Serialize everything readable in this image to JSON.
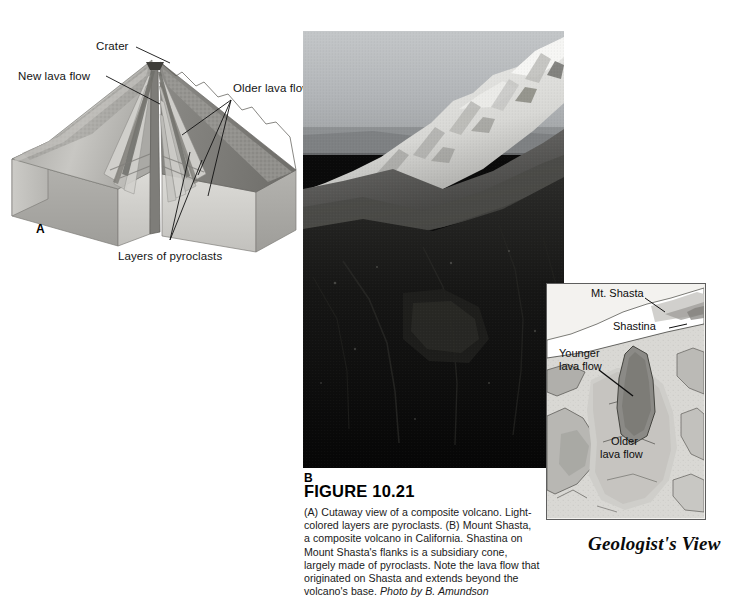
{
  "figure": {
    "number": "FIGURE 10.21",
    "caption_main": "(A) Cutaway view of a composite volcano. Light-colored layers are pyroclasts. (B) Mount Shasta, a composite volcano in California. Shastina on Mount Shasta's flanks is a subsidiary cone, largely made of pyroclasts. Note the lava flow that originated on Shasta and extends beyond the volcano's base. ",
    "caption_credit": "Photo by B. Amundson"
  },
  "part_a": {
    "letter": "A",
    "labels": {
      "crater": "Crater",
      "new_lava_flow": "New lava flow",
      "older_lava_flows": "Older lava flows",
      "layers_of_pyroclasts": "Layers of pyroclasts"
    },
    "colors": {
      "block_top_face": "#b9b8b4",
      "block_front_face": "#a9a8a4",
      "block_side_face": "#c3c2be",
      "cone_surface": "#8f8e8a",
      "pyroclast_layer": "#d9d8d4",
      "lava_flow_dark": "#6e6d69",
      "conduit": "#7a7975"
    }
  },
  "part_b": {
    "letter": "B",
    "subject": "Mount Shasta, California",
    "colors": {
      "sky": "#b9bcbe",
      "snow": "#e9e9e7",
      "rock_dark": "#0d0d0d",
      "mid_slope": "#5a5a58"
    }
  },
  "inset": {
    "title": "Geologist's View",
    "labels": {
      "mt_shasta": "Mt. Shasta",
      "shastina": "Shastina",
      "younger_lava_flow_line1": "Younger",
      "younger_lava_flow_line2": "lava flow",
      "older_lava_flow_line1": "Older",
      "older_lava_flow_line2": "lava flow"
    },
    "colors": {
      "background": "#f2f1ee",
      "border": "#5e5e5e",
      "base_fill": "#d7d6d2",
      "mid_fill": "#b2b1ad",
      "dark_fill": "#8b8a86",
      "snow_fill": "#ffffff",
      "outline": "#4a4a4a"
    }
  }
}
